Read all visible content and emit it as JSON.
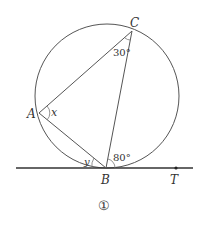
{
  "figure": {
    "number_label": "①",
    "circle": {
      "cx": 107,
      "cy": 96,
      "r": 72
    },
    "points": {
      "A": {
        "label": "A",
        "x": 39,
        "y": 113
      },
      "B": {
        "label": "B",
        "x": 106,
        "y": 168
      },
      "C": {
        "label": "C",
        "x": 132,
        "y": 31
      },
      "T": {
        "label": "T",
        "x": 176,
        "y": 168
      }
    },
    "angles": {
      "x": "x",
      "y": "y",
      "angle_C": "30°",
      "angle_CBT": "80°"
    },
    "colors": {
      "stroke": "#555555",
      "tangent": "#333333",
      "text": "#333333"
    }
  }
}
